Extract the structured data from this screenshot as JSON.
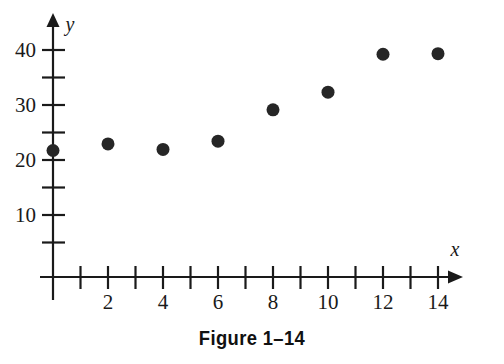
{
  "figure": {
    "caption": "Figure 1–14"
  },
  "chart_data": {
    "type": "scatter",
    "title": "Figure 1–14",
    "xlabel": "x",
    "ylabel": "y",
    "xlim": [
      0,
      15
    ],
    "ylim": [
      0,
      45
    ],
    "grid": false,
    "legend": null,
    "x_major_ticks": [
      2,
      4,
      6,
      8,
      10,
      12,
      14
    ],
    "x_minor_ticks": [
      1,
      3,
      5,
      7,
      9,
      11,
      13
    ],
    "x_tick_labels": [
      "2",
      "4",
      "6",
      "8",
      "10",
      "12",
      "14"
    ],
    "y_major_ticks": [
      10,
      20,
      30,
      40
    ],
    "y_minor_ticks": [
      5,
      15,
      25,
      35
    ],
    "y_tick_labels": [
      "10",
      "20",
      "30",
      "40"
    ],
    "marker": {
      "shape": "circle",
      "color": "#262626",
      "radius": 6.5
    },
    "axis_color": "#1a1a1a",
    "points": [
      {
        "x": 0,
        "y": 23.0
      },
      {
        "x": 2,
        "y": 24.2
      },
      {
        "x": 4,
        "y": 23.2
      },
      {
        "x": 6,
        "y": 24.7
      },
      {
        "x": 8,
        "y": 30.4
      },
      {
        "x": 10,
        "y": 33.6
      },
      {
        "x": 12,
        "y": 40.5
      },
      {
        "x": 14,
        "y": 40.6
      }
    ],
    "x": [
      0,
      2,
      4,
      6,
      8,
      10,
      12,
      14
    ],
    "values": [
      23.0,
      24.2,
      23.2,
      24.7,
      30.4,
      33.6,
      40.5,
      40.6
    ]
  }
}
